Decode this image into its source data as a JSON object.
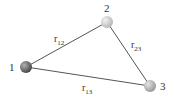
{
  "diagram": {
    "particles": [
      {
        "id": "1",
        "label": "1",
        "x": 26,
        "y": 67,
        "color": "#6f6f6f"
      },
      {
        "id": "2",
        "label": "2",
        "x": 107,
        "y": 22,
        "color": "#cfcfcf"
      },
      {
        "id": "3",
        "label": "3",
        "x": 150,
        "y": 86,
        "color": "#bdbdbd"
      }
    ],
    "edges": [
      {
        "from": "1",
        "to": "2",
        "label": "r",
        "sub": "12"
      },
      {
        "from": "2",
        "to": "3",
        "label": "r",
        "sub": "23"
      },
      {
        "from": "1",
        "to": "3",
        "label": "r",
        "sub": "13"
      }
    ],
    "line_color": "#555555"
  }
}
